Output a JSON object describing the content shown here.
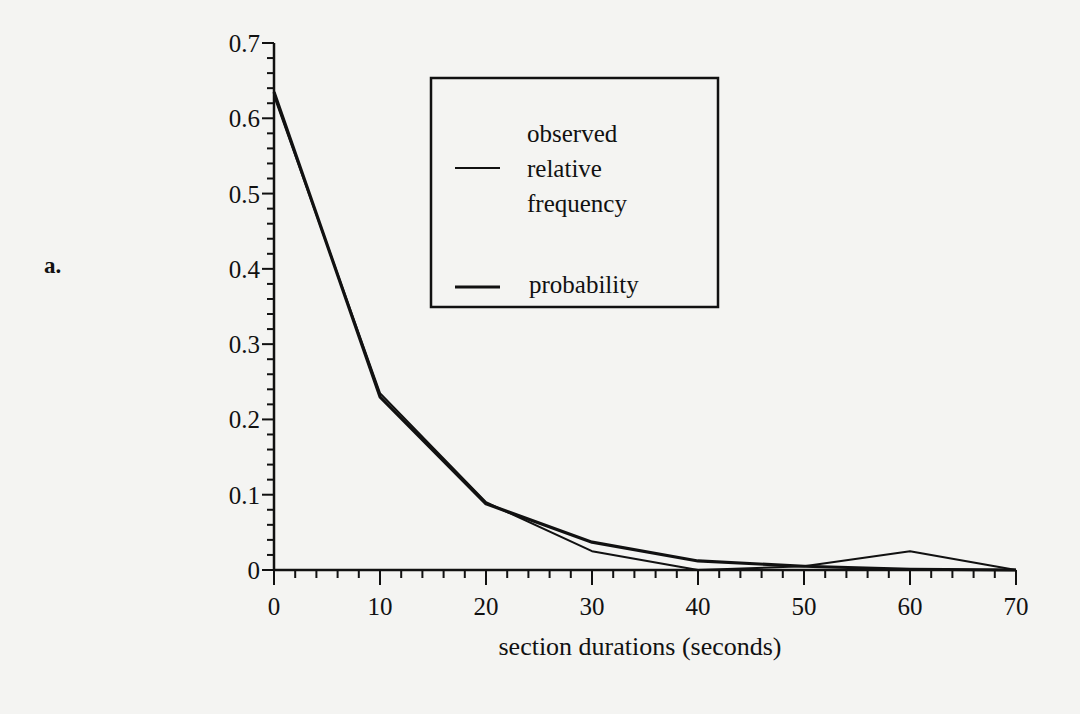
{
  "panel_label": "a.",
  "chart_data": {
    "type": "line",
    "title": "",
    "xlabel": "section durations (seconds)",
    "ylabel": "",
    "x": [
      0,
      10,
      20,
      30,
      40,
      50,
      60,
      70
    ],
    "xticks": [
      "0",
      "10",
      "20",
      "30",
      "40",
      "50",
      "60",
      "70"
    ],
    "yticks": [
      "0",
      "0.1",
      "0.2",
      "0.3",
      "0.4",
      "0.5",
      "0.6",
      "0.7"
    ],
    "xlim": [
      0,
      70
    ],
    "ylim": [
      0,
      0.7
    ],
    "grid": false,
    "legend_position": "upper center (boxed)",
    "series": [
      {
        "name": "observed relative frequency",
        "values": [
          0.63,
          0.235,
          0.09,
          0.025,
          0.0,
          0.005,
          0.025,
          0.0
        ]
      },
      {
        "name": "probability",
        "values": [
          0.635,
          0.23,
          0.088,
          0.037,
          0.012,
          0.005,
          0.001,
          0.0
        ]
      }
    ]
  },
  "legend": {
    "items": [
      {
        "lines": [
          "observed",
          "relative",
          "frequency"
        ]
      },
      {
        "lines": [
          "probability"
        ]
      }
    ]
  }
}
